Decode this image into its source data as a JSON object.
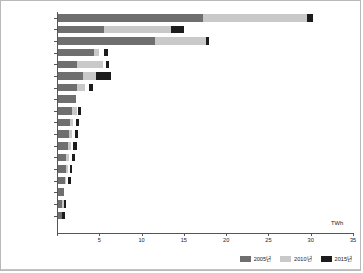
{
  "chart_data": {
    "type": "bar",
    "orientation": "horizontal",
    "stacked": true,
    "title": "",
    "xlabel": "TWh",
    "ylabel": "",
    "xlim": [
      0,
      35
    ],
    "xticks": [
      0,
      5,
      10,
      15,
      20,
      25,
      30,
      35
    ],
    "grid": false,
    "legend_position": "bottom-right",
    "unit": "TWh",
    "categories": [
      "서비스업",
      "영상통합",
      "가정용",
      "석유화학",
      "공공용",
      "기타 기계",
      "자동차",
      "섬유의복",
      "펄프종이",
      "조립금속",
      "식료품",
      "1차금속",
      "농림어업",
      "요업",
      "전기기기",
      "가구/기타",
      "의료과학",
      "출판인쇄"
    ],
    "series": [
      {
        "name": "2005년",
        "color": "#6f6f6f",
        "values": [
          17.1,
          5.4,
          11.5,
          4.2,
          2.3,
          2.9,
          2.2,
          2.1,
          1.7,
          1.4,
          1.3,
          1.2,
          1.0,
          0.9,
          0.8,
          0.7,
          0.5,
          0.5
        ]
      },
      {
        "name": "2010년",
        "color": "#c9c9c9",
        "values": [
          12.4,
          8.0,
          6.0,
          0.7,
          3.0,
          1.6,
          1.0,
          0.0,
          0.5,
          0.4,
          0.4,
          0.3,
          0.3,
          0.3,
          0.2,
          0.0,
          0.2,
          0.0
        ]
      },
      {
        "name": "2015년",
        "color": "#1c1c1c",
        "values": [
          0.6,
          1.5,
          0.4,
          0.5,
          0.3,
          1.8,
          0.4,
          0.0,
          0.3,
          0.4,
          0.4,
          0.4,
          0.4,
          0.3,
          0.3,
          0.0,
          0.2,
          0.3
        ]
      }
    ],
    "gaps": [
      {
        "category": "석유화학",
        "before_series": "2015년",
        "gap": 0.5
      },
      {
        "category": "공공용",
        "before_series": "2015년",
        "gap": 0.4
      },
      {
        "category": "자동차",
        "before_series": "2015년",
        "gap": 0.5
      },
      {
        "category": "펄프종이",
        "before_series": "2015년",
        "gap": 0.2
      },
      {
        "category": "조립금속",
        "before_series": "2015년",
        "gap": 0.3
      },
      {
        "category": "식료품",
        "before_series": "2015년",
        "gap": 0.3
      },
      {
        "category": "1차금속",
        "before_series": "2015년",
        "gap": 0.3
      },
      {
        "category": "농림어업",
        "before_series": "2015년",
        "gap": 0.3
      },
      {
        "category": "요업",
        "before_series": "2015년",
        "gap": 0.2
      },
      {
        "category": "전기기기",
        "before_series": "2015년",
        "gap": 0.2
      }
    ]
  }
}
